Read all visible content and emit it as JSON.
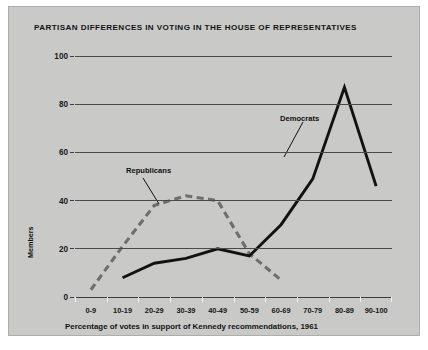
{
  "chart_data": {
    "type": "line",
    "title": "PARTISAN DIFFERENCES IN VOTING IN THE HOUSE OF REPRESENTATIVES",
    "xlabel": "Percentage of votes in support of Kennedy recommendations, 1961",
    "ylabel": "Members",
    "categories": [
      "0-9",
      "10-19",
      "20-29",
      "30-39",
      "40-49",
      "50-59",
      "60-69",
      "70-79",
      "80-89",
      "90-100"
    ],
    "ylim": [
      0,
      100
    ],
    "yticks": [
      0,
      20,
      40,
      60,
      80,
      100
    ],
    "grid": true,
    "legend_position": "inline-annotations",
    "series": [
      {
        "name": "Republicans",
        "style": "dashed",
        "color": "#6e6e6c",
        "values": [
          3,
          21,
          38,
          42,
          40,
          18,
          7,
          null,
          null,
          null
        ]
      },
      {
        "name": "Democrats",
        "style": "solid",
        "color": "#121212",
        "values": [
          null,
          8,
          14,
          16,
          20,
          17,
          30,
          49,
          87,
          46
        ]
      }
    ],
    "annotations": [
      {
        "text": "Republicans",
        "target_category": "30-39"
      },
      {
        "text": "Democrats",
        "target_category": "70-79"
      }
    ]
  },
  "colors": {
    "plate": "#c9c9c7",
    "page": "#ffffff",
    "grid": "#4a4a48",
    "democrats": "#121212",
    "republicans": "#6e6e6c",
    "text": "#141414"
  }
}
